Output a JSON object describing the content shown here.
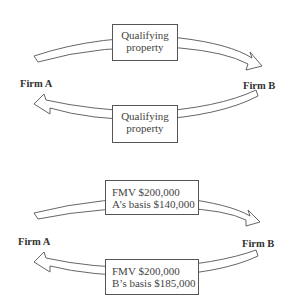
{
  "diagrams": [
    {
      "left_party": "Firm A",
      "right_party": "Firm B",
      "top_transfer": {
        "direction": "A-to-B",
        "lines": [
          "Qualifying",
          "property"
        ]
      },
      "bottom_transfer": {
        "direction": "B-to-A",
        "lines": [
          "Qualifying",
          "property"
        ]
      }
    },
    {
      "left_party": "Firm A",
      "right_party": "Firm B",
      "top_transfer": {
        "direction": "A-to-B",
        "lines": [
          "FMV $200,000",
          "A’s basis $140,000"
        ]
      },
      "bottom_transfer": {
        "direction": "B-to-A",
        "lines": [
          "FMV $200,000",
          "B’s basis $185,000"
        ]
      }
    }
  ],
  "icons": {
    "top_arrow": "curved-arrow-right",
    "bottom_arrow": "curved-arrow-left"
  }
}
